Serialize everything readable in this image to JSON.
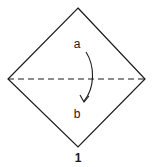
{
  "diagram": {
    "type": "origami-fold-step",
    "step_number": "1",
    "labels": {
      "top_point": "a",
      "bottom_point": "b"
    },
    "shape": {
      "kind": "square-on-point",
      "vertices": {
        "top": [
          78,
          8
        ],
        "right": [
          145,
          79
        ],
        "bottom": [
          78,
          147
        ],
        "left": [
          8,
          79
        ]
      }
    },
    "fold_line": {
      "style": "dashed",
      "kind": "valley-fold",
      "from": [
        8,
        79
      ],
      "to": [
        145,
        79
      ]
    },
    "arrow": {
      "direction": "down",
      "from_label": "a",
      "to_label": "b"
    },
    "colors": {
      "line": "#1a1a1a",
      "background": "#ffffff"
    }
  }
}
